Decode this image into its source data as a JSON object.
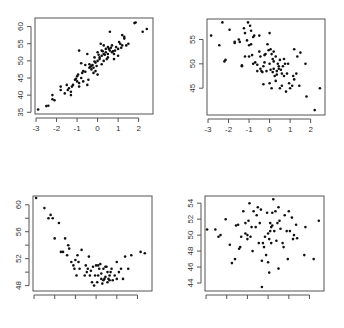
{
  "chart_data": [
    {
      "type": "scatter",
      "title": "",
      "xlabel": "",
      "ylabel": "",
      "frame": {
        "x0": 35,
        "y0": 18,
        "x1": 153,
        "y1": 114
      },
      "xlim": [
        -3.05,
        2.7
      ],
      "ylim": [
        34.5,
        62.5
      ],
      "xticks": [
        -3,
        -2,
        -1,
        0,
        1,
        2
      ],
      "xtick_labels": [
        "-3",
        "-2",
        "-1",
        "0",
        "1",
        "2"
      ],
      "yticks": [
        35,
        40,
        45,
        50,
        55,
        60
      ],
      "ytick_labels": [
        "35",
        "40",
        "45",
        "50",
        "55",
        "60"
      ],
      "points": [
        [
          -2.9,
          35.8
        ],
        [
          -2.5,
          36.8
        ],
        [
          -2.4,
          36.9
        ],
        [
          -2.2,
          38.8
        ],
        [
          -2.2,
          40
        ],
        [
          -2.1,
          38.5
        ],
        [
          -1.8,
          41.5
        ],
        [
          -1.8,
          42.5
        ],
        [
          -1.6,
          40.5
        ],
        [
          -1.5,
          43
        ],
        [
          -1.4,
          42
        ],
        [
          -1.3,
          41
        ],
        [
          -1.3,
          40
        ],
        [
          -1.2,
          43
        ],
        [
          -1.1,
          44.5
        ],
        [
          -1.0,
          45.5
        ],
        [
          -1.0,
          44
        ],
        [
          -0.9,
          42.5
        ],
        [
          -0.9,
          43.5
        ],
        [
          -0.8,
          45
        ],
        [
          -0.8,
          49.3
        ],
        [
          -0.9,
          53
        ],
        [
          -0.7,
          44
        ],
        [
          -0.7,
          47
        ],
        [
          -0.6,
          46.8
        ],
        [
          -0.5,
          43
        ],
        [
          -0.4,
          48
        ],
        [
          -0.4,
          49
        ],
        [
          -0.3,
          48.5
        ],
        [
          -0.3,
          47.5
        ],
        [
          -0.2,
          48
        ],
        [
          -0.2,
          46.5
        ],
        [
          -0.1,
          47
        ],
        [
          -0.1,
          49.5
        ],
        [
          0.0,
          50
        ],
        [
          0.0,
          46
        ],
        [
          0.0,
          52.5
        ],
        [
          0.1,
          50.5
        ],
        [
          0.1,
          51
        ],
        [
          0.2,
          49
        ],
        [
          0.2,
          51.5
        ],
        [
          0.2,
          53
        ],
        [
          0.3,
          50
        ],
        [
          0.3,
          52
        ],
        [
          0.4,
          52.5
        ],
        [
          0.4,
          53.5
        ],
        [
          0.5,
          51
        ],
        [
          0.5,
          54
        ],
        [
          0.5,
          52
        ],
        [
          0.6,
          53
        ],
        [
          0.6,
          58.5
        ],
        [
          0.7,
          52.5
        ],
        [
          0.7,
          54.5
        ],
        [
          0.8,
          50.5
        ],
        [
          0.8,
          52
        ],
        [
          0.9,
          54
        ],
        [
          1.0,
          53.5
        ],
        [
          1.0,
          51.5
        ],
        [
          1.1,
          55
        ],
        [
          1.2,
          57.5
        ],
        [
          1.2,
          54.5
        ],
        [
          1.3,
          56.5
        ],
        [
          1.3,
          57
        ],
        [
          1.4,
          54.5
        ],
        [
          1.5,
          55
        ],
        [
          1.8,
          61
        ],
        [
          1.85,
          61.2
        ],
        [
          2.2,
          58.5
        ],
        [
          2.4,
          59.3
        ],
        [
          -0.5,
          52
        ],
        [
          0.15,
          55
        ],
        [
          0.3,
          54.5
        ],
        [
          0.55,
          53.5
        ],
        [
          -0.35,
          48.3
        ],
        [
          -0.15,
          49.8
        ],
        [
          0.05,
          51.8
        ],
        [
          0.25,
          52.8
        ],
        [
          -0.6,
          48.8
        ],
        [
          -0.95,
          46
        ],
        [
          -1.05,
          44.8
        ],
        [
          -1.25,
          42.5
        ],
        [
          -1.45,
          41.5
        ],
        [
          -0.15,
          51
        ],
        [
          0.45,
          50.5
        ],
        [
          0.65,
          53.8
        ],
        [
          0.85,
          53
        ],
        [
          1.05,
          55.5
        ],
        [
          -0.45,
          44.5
        ],
        [
          -0.25,
          48.8
        ],
        [
          0.35,
          51.8
        ],
        [
          -0.75,
          46.5
        ],
        [
          -0.05,
          48.5
        ],
        [
          0.75,
          52.8
        ],
        [
          1.15,
          53.8
        ]
      ]
    },
    {
      "type": "scatter",
      "title": "",
      "xlabel": "",
      "ylabel": "",
      "frame": {
        "x0": 207,
        "y0": 19,
        "x1": 325,
        "y1": 115
      },
      "xlim": [
        -3.05,
        2.7
      ],
      "ylim": [
        39.5,
        59.2
      ],
      "xticks": [
        -3,
        -2,
        -1,
        0,
        1,
        2
      ],
      "xtick_labels": [
        "-3",
        "-2",
        "-1",
        "0",
        "1",
        "2"
      ],
      "yticks": [
        45,
        50,
        55
      ],
      "ytick_labels": [
        "45",
        "50",
        "55"
      ],
      "points": [
        [
          -2.85,
          55.8
        ],
        [
          -2.45,
          53.8
        ],
        [
          -2.3,
          58.5
        ],
        [
          -2.2,
          50.5
        ],
        [
          -2.15,
          50.8
        ],
        [
          -1.95,
          57
        ],
        [
          -1.7,
          54.3
        ],
        [
          -1.7,
          54.5
        ],
        [
          -1.5,
          55
        ],
        [
          -1.45,
          54.5
        ],
        [
          -1.35,
          49.5
        ],
        [
          -1.35,
          49.7
        ],
        [
          -1.25,
          57.3
        ],
        [
          -1.2,
          56.3
        ],
        [
          -1.2,
          51.5
        ],
        [
          -1.1,
          54.8
        ],
        [
          -1.05,
          58.5
        ],
        [
          -1.0,
          53.8
        ],
        [
          -1.0,
          51.5
        ],
        [
          -0.95,
          57.8
        ],
        [
          -0.9,
          56.8
        ],
        [
          -0.9,
          54
        ],
        [
          -0.85,
          51.8
        ],
        [
          -0.8,
          50
        ],
        [
          -0.8,
          55.5
        ],
        [
          -0.75,
          55.8
        ],
        [
          -0.7,
          50.3
        ],
        [
          -0.6,
          48.5
        ],
        [
          -0.5,
          55.8
        ],
        [
          -0.5,
          52.5
        ],
        [
          -0.45,
          49
        ],
        [
          -0.4,
          48.5
        ],
        [
          -0.35,
          48.3
        ],
        [
          -0.3,
          45.8
        ],
        [
          -0.3,
          49.5
        ],
        [
          -0.25,
          50.3
        ],
        [
          -0.2,
          52
        ],
        [
          -0.15,
          48.5
        ],
        [
          -0.1,
          54
        ],
        [
          -0.05,
          52.8
        ],
        [
          0.0,
          56.3
        ],
        [
          0.0,
          46
        ],
        [
          0.0,
          50
        ],
        [
          0.05,
          48.8
        ],
        [
          0.1,
          52
        ],
        [
          0.1,
          45
        ],
        [
          0.15,
          51
        ],
        [
          0.2,
          49
        ],
        [
          0.2,
          50.5
        ],
        [
          0.2,
          52.5
        ],
        [
          0.25,
          47.5
        ],
        [
          0.3,
          46.5
        ],
        [
          0.3,
          51.5
        ],
        [
          0.35,
          48.5
        ],
        [
          0.4,
          50
        ],
        [
          0.45,
          49.5
        ],
        [
          0.5,
          45
        ],
        [
          0.5,
          50.8
        ],
        [
          0.55,
          48.8
        ],
        [
          0.6,
          45.5
        ],
        [
          0.6,
          48
        ],
        [
          0.65,
          49.5
        ],
        [
          0.7,
          51
        ],
        [
          0.75,
          50
        ],
        [
          0.8,
          44.3
        ],
        [
          0.85,
          48
        ],
        [
          0.9,
          50
        ],
        [
          0.95,
          46
        ],
        [
          1.0,
          45
        ],
        [
          1.1,
          45.5
        ],
        [
          1.15,
          47.5
        ],
        [
          1.2,
          46.8
        ],
        [
          1.2,
          53
        ],
        [
          1.3,
          48
        ],
        [
          1.35,
          51.5
        ],
        [
          1.45,
          45.5
        ],
        [
          1.5,
          52.3
        ],
        [
          1.75,
          50
        ],
        [
          1.8,
          43.3
        ],
        [
          2.2,
          40.5
        ],
        [
          2.45,
          45
        ],
        [
          -0.6,
          49.8
        ],
        [
          -0.25,
          51.8
        ],
        [
          0.05,
          53
        ],
        [
          0.35,
          47.8
        ],
        [
          0.45,
          49
        ],
        [
          0.15,
          48.3
        ],
        [
          -0.45,
          51.5
        ],
        [
          0.7,
          47.5
        ]
      ]
    },
    {
      "type": "scatter",
      "title": "",
      "xlabel": "",
      "ylabel": "",
      "frame": {
        "x0": 33,
        "y0": 196,
        "x1": 152,
        "y1": 291
      },
      "xlim": [
        -3.05,
        2.7
      ],
      "ylim": [
        47.2,
        61.3
      ],
      "xticks": [
        -3,
        -2,
        -1,
        0,
        1,
        2
      ],
      "xtick_labels": [
        "",
        "",
        "",
        "",
        "",
        ""
      ],
      "yticks": [
        48,
        52,
        56,
        60
      ],
      "ytick_labels": [
        "48",
        "52",
        "56",
        "60"
      ],
      "yminor": [
        50,
        54,
        58
      ],
      "points": [
        [
          -2.9,
          61
        ],
        [
          -2.5,
          59.5
        ],
        [
          -2.3,
          58
        ],
        [
          -2.2,
          58.5
        ],
        [
          -2.1,
          58
        ],
        [
          -2.0,
          55
        ],
        [
          -1.8,
          57.3
        ],
        [
          -1.7,
          53
        ],
        [
          -1.6,
          53
        ],
        [
          -1.5,
          55
        ],
        [
          -1.4,
          52.5
        ],
        [
          -1.35,
          54
        ],
        [
          -1.3,
          53.5
        ],
        [
          -1.2,
          51.5
        ],
        [
          -1.1,
          51
        ],
        [
          -1.05,
          50.5
        ],
        [
          -1.0,
          51.8
        ],
        [
          -0.95,
          49.5
        ],
        [
          -0.9,
          52.5
        ],
        [
          -0.85,
          51.5
        ],
        [
          -0.8,
          50.5
        ],
        [
          -0.7,
          53.3
        ],
        [
          -0.55,
          49.5
        ],
        [
          -0.5,
          51
        ],
        [
          -0.4,
          50.5
        ],
        [
          -0.35,
          52.3
        ],
        [
          -0.3,
          49.5
        ],
        [
          -0.2,
          48.5
        ],
        [
          -0.15,
          50.8
        ],
        [
          -0.1,
          48
        ],
        [
          -0.05,
          49.5
        ],
        [
          0.0,
          51
        ],
        [
          0.05,
          48.5
        ],
        [
          0.1,
          49.5
        ],
        [
          0.15,
          50.5
        ],
        [
          0.2,
          51.2
        ],
        [
          0.25,
          49.8
        ],
        [
          0.3,
          48.3
        ],
        [
          0.35,
          50.5
        ],
        [
          0.4,
          49
        ],
        [
          0.45,
          49.3
        ],
        [
          0.5,
          50.8
        ],
        [
          0.55,
          48.5
        ],
        [
          0.6,
          49
        ],
        [
          0.65,
          48.8
        ],
        [
          0.7,
          50
        ],
        [
          0.75,
          50.5
        ],
        [
          0.8,
          48.8
        ],
        [
          0.9,
          49.5
        ],
        [
          1.0,
          51.5
        ],
        [
          1.1,
          50
        ],
        [
          1.2,
          50.5
        ],
        [
          1.3,
          49
        ],
        [
          1.4,
          52.3
        ],
        [
          1.55,
          50.5
        ],
        [
          1.7,
          52.5
        ],
        [
          2.15,
          53
        ],
        [
          2.35,
          52.8
        ],
        [
          1.0,
          49
        ],
        [
          0.55,
          50
        ],
        [
          0.25,
          49
        ],
        [
          0.1,
          51
        ],
        [
          -0.25,
          50.2
        ],
        [
          0.65,
          49.5
        ],
        [
          0.45,
          50.8
        ],
        [
          0.35,
          48.8
        ],
        [
          -0.45,
          50
        ]
      ]
    },
    {
      "type": "scatter",
      "title": "",
      "xlabel": "",
      "ylabel": "",
      "frame": {
        "x0": 205,
        "y0": 196,
        "x1": 324,
        "y1": 291
      },
      "xlim": [
        -3.05,
        2.7
      ],
      "ylim": [
        43,
        54.9
      ],
      "xticks": [
        -3,
        -2,
        -1,
        0,
        1,
        2
      ],
      "xtick_labels": [
        "",
        "",
        "",
        "",
        "",
        ""
      ],
      "yticks": [
        44,
        46,
        48,
        50,
        52,
        54
      ],
      "ytick_labels": [
        "44",
        "46",
        "48",
        "50",
        "52",
        "54"
      ],
      "points": [
        [
          -2.95,
          50.7
        ],
        [
          -2.55,
          50.7
        ],
        [
          -2.4,
          49.8
        ],
        [
          -2.3,
          50
        ],
        [
          -2.05,
          52
        ],
        [
          -1.85,
          48.8
        ],
        [
          -1.6,
          47
        ],
        [
          -1.55,
          51.2
        ],
        [
          -1.45,
          51.3
        ],
        [
          -1.4,
          48.3
        ],
        [
          -1.35,
          48.5
        ],
        [
          -1.3,
          49.8
        ],
        [
          -1.2,
          53
        ],
        [
          -1.1,
          51.5
        ],
        [
          -1.0,
          50
        ],
        [
          -1.0,
          49.5
        ],
        [
          -0.95,
          51.8
        ],
        [
          -0.9,
          54
        ],
        [
          -0.85,
          49.8
        ],
        [
          -0.8,
          51
        ],
        [
          -0.75,
          48
        ],
        [
          -0.7,
          53
        ],
        [
          -0.6,
          51
        ],
        [
          -0.55,
          52.5
        ],
        [
          -0.5,
          53.5
        ],
        [
          -0.45,
          49
        ],
        [
          -0.4,
          51.5
        ],
        [
          -0.35,
          53.2
        ],
        [
          -0.3,
          46.8
        ],
        [
          -0.25,
          49
        ],
        [
          -0.2,
          48.5
        ],
        [
          -0.1,
          47.5
        ],
        [
          -0.05,
          52.8
        ],
        [
          0.0,
          50.2
        ],
        [
          0.0,
          46.6
        ],
        [
          0.05,
          49.5
        ],
        [
          0.1,
          51.5
        ],
        [
          0.1,
          50.5
        ],
        [
          0.15,
          49
        ],
        [
          0.2,
          52.8
        ],
        [
          0.25,
          54.5
        ],
        [
          0.3,
          50.5
        ],
        [
          0.35,
          53
        ],
        [
          0.4,
          49.3
        ],
        [
          0.45,
          51.5
        ],
        [
          0.5,
          53.5
        ],
        [
          0.5,
          45.8
        ],
        [
          0.55,
          51.8
        ],
        [
          0.6,
          50.8
        ],
        [
          0.7,
          49
        ],
        [
          0.75,
          48.5
        ],
        [
          0.8,
          52.5
        ],
        [
          0.9,
          50.5
        ],
        [
          0.95,
          47
        ],
        [
          1.0,
          53
        ],
        [
          1.05,
          50.5
        ],
        [
          1.15,
          52.2
        ],
        [
          1.2,
          49.5
        ],
        [
          1.25,
          50
        ],
        [
          1.35,
          51.3
        ],
        [
          1.4,
          49.6
        ],
        [
          1.75,
          47.5
        ],
        [
          1.8,
          51
        ],
        [
          2.2,
          47
        ],
        [
          2.45,
          51.8
        ],
        [
          0.2,
          51.2
        ],
        [
          -0.15,
          49.8
        ],
        [
          -0.3,
          43.5
        ],
        [
          0.15,
          51
        ],
        [
          0.05,
          45.3
        ],
        [
          -1.75,
          46.5
        ],
        [
          -1.1,
          50.2
        ]
      ]
    }
  ]
}
